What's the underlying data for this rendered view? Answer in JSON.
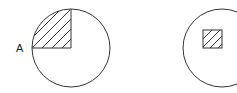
{
  "diagram": {
    "left_figure": {
      "point_label": "A",
      "description": "circle with hatched quarter sector (upper-left quadrant)"
    },
    "right_figure": {
      "description": "circle with small hatched square"
    },
    "colors": {
      "stroke": "#333333",
      "background": "#ffffff"
    }
  }
}
